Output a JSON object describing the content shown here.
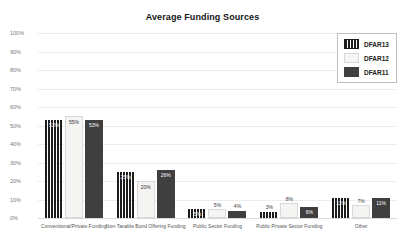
{
  "page": {
    "title": "Average Funding Sources"
  },
  "colors": {
    "background": "#ffffff",
    "grid": "#ececec",
    "baseline": "#d9d9d9",
    "axis_text": "#7a7a7a",
    "category_text": "#555555",
    "legend_border": "#bfbfbf",
    "series_dfar13": "#1c1c1c",
    "series_dfar12": "#f4f4f2",
    "series_dfar11": "#3f3f3f"
  },
  "chart_data": {
    "type": "bar",
    "title": "Average Funding Sources",
    "categories": [
      "Conventional/Private Funding",
      "Non-Taxable Bond Offering Funding",
      "Public Sector Funding",
      "Public-Private Sector Funding",
      "Other"
    ],
    "series": [
      {
        "name": "DFAR13",
        "values": [
          53,
          25,
          5,
          3,
          11
        ],
        "color": "#1c1c1c",
        "striped": true,
        "border": "",
        "label_text_color": "#ffffff"
      },
      {
        "name": "DFAR12",
        "values": [
          55,
          20,
          5,
          8,
          7
        ],
        "color": "#f4f4f2",
        "striped": false,
        "border": "#d9d9d9",
        "label_text_color": "#333333"
      },
      {
        "name": "DFAR11",
        "values": [
          53,
          26,
          4,
          6,
          11
        ],
        "color": "#3f3f3f",
        "striped": false,
        "border": "",
        "label_text_color": "#ffffff"
      }
    ],
    "value_label_format": "percent",
    "xlabel": "",
    "ylabel": "",
    "ylim": [
      0,
      100
    ],
    "yticks": [
      0,
      10,
      20,
      30,
      40,
      50,
      60,
      70,
      80,
      90,
      100
    ],
    "ytick_format": "percent",
    "grid": true,
    "legend_position": "top-right",
    "value_labels": true
  }
}
